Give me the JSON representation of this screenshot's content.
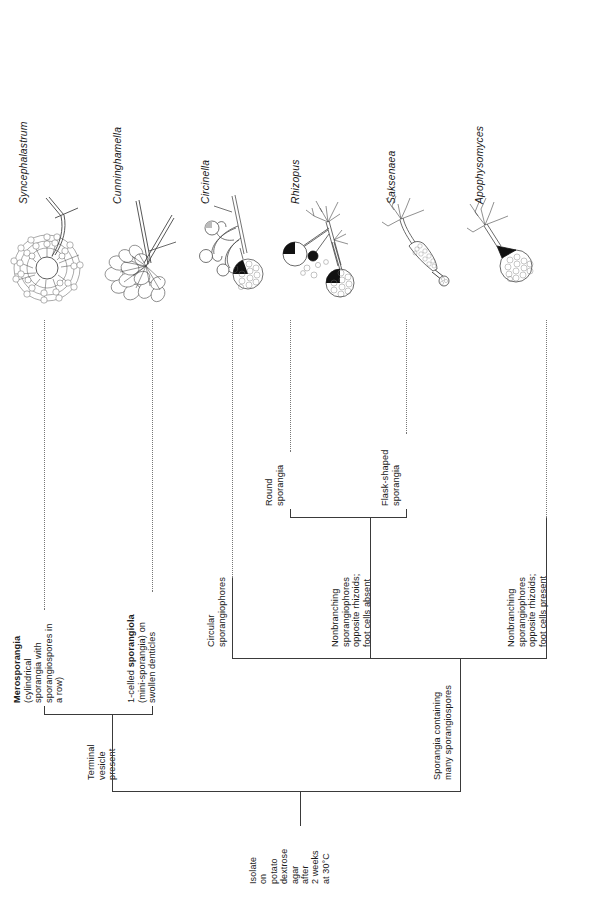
{
  "figure": {
    "kind": "dichotomous-key",
    "orientation": "page-rotated-90-ccw",
    "root_label": "Isolate\non\npotato\ndextrose\nagar\nafter\n2 weeks\nat 30°C",
    "root_label_flat": "Isolate on potato dextrose agar after 2 weeks at 30°C"
  },
  "branches": {
    "terminal_vesicle": "Terminal\nvesicle\npresent",
    "sporangia_many_spores": "Sporangia containing\nmany sporangiospores",
    "merosporangia": "Merosporangia",
    "merosporangia_detail": "(cylindrical\nsporangia with\nsporangiospores in\na row)",
    "one_celled_lead": "1-celled ",
    "one_celled_bold": "sporangiola",
    "one_celled_detail": "(mini-sporangia) on\nswollen denticles",
    "circular": "Circular\nsporangiophores",
    "nonbranching_absent": "Nonbranching\nsporangiophores\nopposite rhizoids;\nfoot cells absent",
    "nonbranching_present": "Nonbranching\nsporangiophores\nopposite rhizoids;\nfoot cells present",
    "round_sporangia": "Round\nsporangia",
    "flask_sporangia": "Flask-shaped\nsporangia"
  },
  "taxa": [
    {
      "name": "Syncephalastrum",
      "art": "syncephalastrum-drawing"
    },
    {
      "name": "Cunninghamella",
      "art": "cunninghamella-drawing"
    },
    {
      "name": "Circinella",
      "art": "circinella-drawing"
    },
    {
      "name": "Rhizopus",
      "art": "rhizopus-drawing"
    },
    {
      "name": "Saksenaea",
      "art": "saksenaea-drawing"
    },
    {
      "name": "Apophysomyces",
      "art": "apophysomyces-drawing"
    }
  ],
  "colors": {
    "ink": "#1a1a1a",
    "rule": "#3a3a3a",
    "leader": "#777777",
    "paper": "#ffffff"
  }
}
